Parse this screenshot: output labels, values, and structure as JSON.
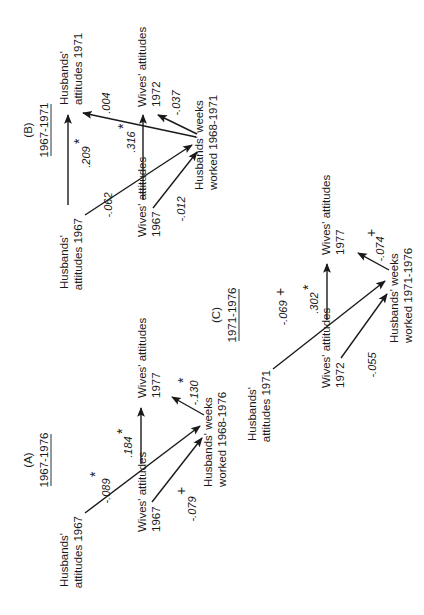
{
  "panels": {
    "A": {
      "letter": "(A)",
      "period": "1967-1976",
      "nodes": {
        "husbands_prior": [
          "Husbands'",
          "attitudes 1967"
        ],
        "wives_prior": [
          "Wives' attitudes",
          "1967"
        ],
        "wives_outcome": [
          "Wives' attitudes",
          "1977"
        ],
        "weeks_worked": [
          "Husbands' weeks",
          "worked 1968-1976"
        ]
      },
      "paths": {
        "husbands_to_weeks": {
          "value": "-.089",
          "sig": "*"
        },
        "wives_prior_to_outcome": {
          "value": ".184",
          "sig": "*"
        },
        "wives_prior_to_weeks": {
          "value": "-.079",
          "sig": "+"
        },
        "weeks_to_wives_outcome": {
          "value": "-.130",
          "sig": "*"
        }
      }
    },
    "B": {
      "letter": "(B)",
      "period": "1967-1971",
      "nodes": {
        "husbands_prior": [
          "Husbands'",
          "attitudes 1967"
        ],
        "husbands_outcome": [
          "Husbands'",
          "attitudes 1971"
        ],
        "wives_prior": [
          "Wives' attitudes",
          "1967"
        ],
        "wives_outcome": [
          "Wives' attitudes",
          "1972"
        ],
        "weeks_worked": [
          "Husbands' weeks",
          "worked 1968-1971"
        ]
      },
      "paths": {
        "husbands_prior_to_outcome": {
          "value": ".209",
          "sig": "*"
        },
        "husbands_to_weeks": {
          "value": "-.062",
          "sig": ""
        },
        "wives_prior_to_outcome": {
          "value": ".316",
          "sig": "*"
        },
        "wives_prior_to_weeks": {
          "value": "-.012",
          "sig": ""
        },
        "weeks_to_husbands_outcome": {
          "value": ".004",
          "sig": ""
        },
        "weeks_to_wives_outcome": {
          "value": "-.037",
          "sig": ""
        }
      }
    },
    "C": {
      "letter": "(C)",
      "period": "1971-1976",
      "nodes": {
        "husbands_prior": [
          "Husbands'",
          "attitudes 1971"
        ],
        "wives_prior": [
          "Wives' attitudes",
          "1972"
        ],
        "wives_outcome": [
          "Wives' attitudes",
          "1977"
        ],
        "weeks_worked": [
          "Husbands' weeks",
          "worked 1971-1976"
        ]
      },
      "paths": {
        "husbands_to_weeks": {
          "value": "-.069",
          "sig": "+"
        },
        "wives_prior_to_outcome": {
          "value": ".302",
          "sig": "*"
        },
        "wives_prior_to_weeks": {
          "value": "-.055",
          "sig": ""
        },
        "weeks_to_wives_outcome": {
          "value": "-.074",
          "sig": "+"
        }
      }
    }
  }
}
